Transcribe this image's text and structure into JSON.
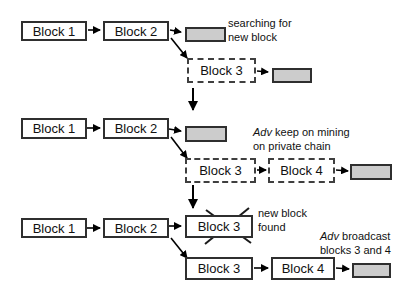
{
  "colors": {
    "background": "#ffffff",
    "block_fill": "#ffffff",
    "block_border": "#2f2f2f",
    "pending_block_fill": "#cccccc",
    "arrow": "#000000",
    "text": "#111111"
  },
  "rows": [
    {
      "blocks": {
        "b1": "Block 1",
        "b2": "Block 2",
        "b3": "Block 3"
      },
      "note": {
        "line1": "searching for",
        "line2": "new block"
      }
    },
    {
      "blocks": {
        "b1": "Block 1",
        "b2": "Block 2",
        "b3": "Block 3",
        "b4": "Block 4"
      },
      "note": {
        "adv": "Adv",
        "line1_rest": " keep on mining",
        "line2": "on private chain"
      }
    },
    {
      "blocks": {
        "b1": "Block 1",
        "b2": "Block 2",
        "b3_crossed": "Block 3",
        "b3": "Block 3",
        "b4": "Block 4"
      },
      "note_found": {
        "line1": "new block",
        "line2": "found"
      },
      "note_broadcast": {
        "adv": "Adv",
        "line1_rest": " broadcast",
        "line2": "blocks 3 and 4"
      }
    }
  ]
}
